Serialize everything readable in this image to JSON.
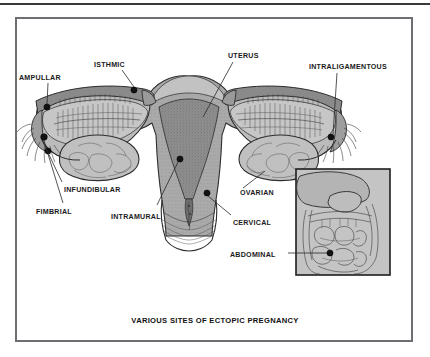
{
  "figure": {
    "caption": "VARIOUS SITES OF ECTOPIC PREGNANCY",
    "frame_color": "#6e6e72",
    "background_color": "#ffffff",
    "tissue_fill": "#b9b9b9",
    "cavity_fill": "#8e8e8e",
    "outline_color": "#2e2e2e",
    "dot_color": "#121212"
  },
  "labels": {
    "ampullar": "AMPULLAR",
    "isthmic": "ISTHMIC",
    "uterus": "UTERUS",
    "intraligamentous": "INTRALIGAMENTOUS",
    "infundibular": "INFUNDIBULAR",
    "fimbrial": "FIMBRIAL",
    "intramural": "INTRAMURAL",
    "ovarian": "OVARIAN",
    "cervical": "CERVICAL",
    "abdominal": "ABDOMINAL"
  },
  "sites": [
    {
      "name": "ampullar",
      "label": "AMPULLAR",
      "side": "left",
      "dot_x": 47,
      "dot_y": 107
    },
    {
      "name": "isthmic",
      "label": "ISTHMIC",
      "side": "left",
      "dot_x": 134,
      "dot_y": 90
    },
    {
      "name": "infundibular",
      "label": "INFUNDIBULAR",
      "side": "left",
      "dot_x": 44,
      "dot_y": 137
    },
    {
      "name": "fimbrial",
      "label": "FIMBRIAL",
      "side": "left",
      "dot_x": 48,
      "dot_y": 151
    },
    {
      "name": "intramural",
      "label": "INTRAMURAL",
      "side": "center",
      "dot_x": 180,
      "dot_y": 159
    },
    {
      "name": "cervical",
      "label": "CERVICAL",
      "side": "center",
      "dot_x": 207,
      "dot_y": 193
    },
    {
      "name": "intraligamentous",
      "label": "INTRALIGAMENTOUS",
      "side": "right",
      "dot_x": 331,
      "dot_y": 137
    },
    {
      "name": "abdominal",
      "label": "ABDOMINAL",
      "side": "inset",
      "dot_x": 330,
      "dot_y": 253
    }
  ],
  "inset": {
    "name": "abdominal-cavity-inset",
    "description": "abdominal cavity showing liver, stomach and intestinal loops"
  }
}
